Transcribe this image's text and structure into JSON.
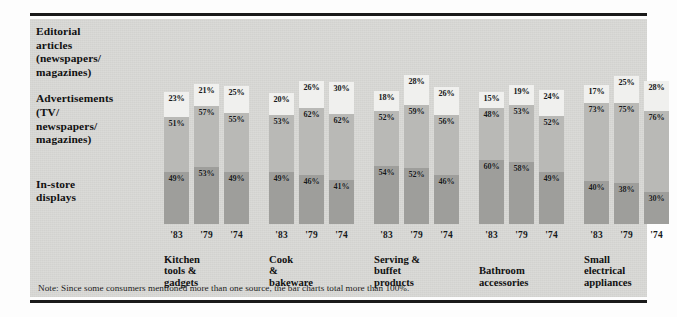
{
  "legend": {
    "items": [
      "Editorial\narticles\n(newspapers/\nmagazines)",
      "Advertisements\n(TV/\nnewspapers/\nmagazines)",
      "In-store\ndisplays"
    ],
    "item1_l1": "Editorial",
    "item1_l2": "articles",
    "item1_l3": "(newspapers/",
    "item1_l4": "magazines)",
    "item2_l1": "Advertisements",
    "item2_l2": "(TV/",
    "item2_l3": "newspapers/",
    "item2_l4": "magazines)",
    "item3_l1": "In-store",
    "item3_l2": "displays"
  },
  "note": "Note: Since some consumers mentioned more than one source, the bar charts total more than 100%.",
  "colors": {
    "editorial": "#f0f0ee",
    "advertisements": "#b9b9b6",
    "instore": "#9e9e9b",
    "panel": "#d9d9d6",
    "rule": "#1a1a1a",
    "text": "#111111"
  },
  "chart_data": {
    "type": "bar",
    "subtype": "stacked-vertical-grouped",
    "title": "",
    "xlabel": "",
    "ylabel": "",
    "grid": false,
    "legend_position": "left",
    "stack_order_bottom_to_top": [
      "In-store displays",
      "Advertisements (TV/newspapers/magazines)",
      "Editorial articles (newspapers/magazines)"
    ],
    "years": [
      "'83",
      "'79",
      "'74"
    ],
    "categories": [
      "Kitchen tools & gadgets",
      "Cook & bakeware",
      "Serving & buffet products",
      "Bathroom accessories",
      "Small electrical appliances",
      "Outdoor products"
    ],
    "category_lines": [
      [
        "Kitchen",
        "tools &",
        "gadgets"
      ],
      [
        "Cook",
        "&",
        "bakeware"
      ],
      [
        "Serving &",
        "buffet",
        "products"
      ],
      [
        "Bathroom",
        "accessories"
      ],
      [
        "Small",
        "electrical",
        "appliances"
      ],
      [
        "Outdoor",
        "products"
      ]
    ],
    "series": [
      {
        "name": "Editorial articles (newspapers/magazines)",
        "color": "#f0f0ee",
        "values": [
          [
            23,
            21,
            25
          ],
          [
            20,
            26,
            30
          ],
          [
            18,
            28,
            26
          ],
          [
            15,
            19,
            24
          ],
          [
            17,
            25,
            28
          ],
          [
            13,
            19,
            19
          ]
        ]
      },
      {
        "name": "Advertisements (TV/newspapers/magazines)",
        "color": "#b9b9b6",
        "values": [
          [
            51,
            57,
            55
          ],
          [
            53,
            62,
            62
          ],
          [
            52,
            59,
            56
          ],
          [
            48,
            53,
            52
          ],
          [
            73,
            75,
            76
          ],
          [
            64,
            69,
            65
          ]
        ]
      },
      {
        "name": "In-store displays",
        "color": "#9e9e9b",
        "values": [
          [
            49,
            53,
            49
          ],
          [
            49,
            46,
            41
          ],
          [
            54,
            52,
            46
          ],
          [
            60,
            58,
            49
          ],
          [
            40,
            38,
            30
          ],
          [
            48,
            46,
            41
          ]
        ]
      }
    ],
    "value_suffix": "%"
  }
}
